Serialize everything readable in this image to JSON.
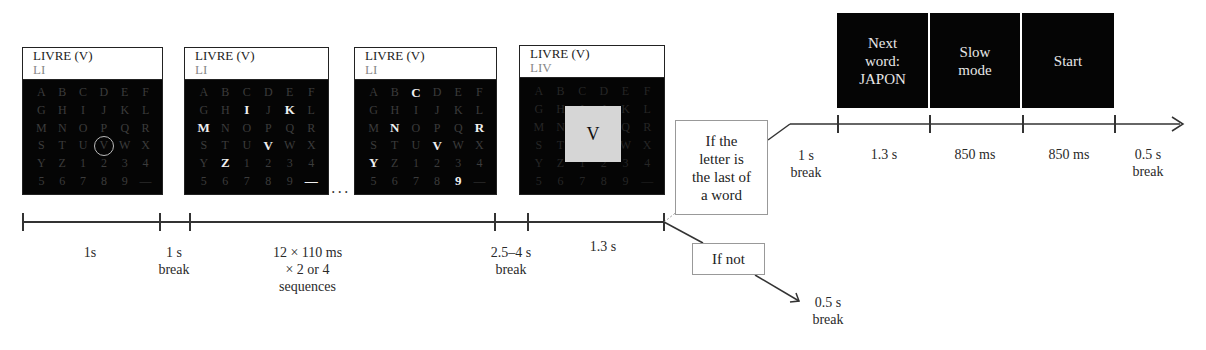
{
  "screens": [
    {
      "target": "LIVRE (V)",
      "typed": "LI",
      "grid": [
        "A",
        "B",
        "C",
        "D",
        "E",
        "F",
        "G",
        "H",
        "I",
        "J",
        "K",
        "L",
        "M",
        "N",
        "O",
        "P",
        "Q",
        "R",
        "S",
        "T",
        "U",
        "V",
        "W",
        "X",
        "Y",
        "Z",
        "1",
        "2",
        "3",
        "4",
        "5",
        "6",
        "7",
        "8",
        "9",
        "—"
      ],
      "highlighted": [],
      "circled": [
        21
      ]
    },
    {
      "target": "LIVRE (V)",
      "typed": "LI",
      "grid": [
        "A",
        "B",
        "C",
        "D",
        "E",
        "F",
        "G",
        "H",
        "I",
        "J",
        "K",
        "L",
        "M",
        "N",
        "O",
        "P",
        "Q",
        "R",
        "S",
        "T",
        "U",
        "V",
        "W",
        "X",
        "Y",
        "Z",
        "1",
        "2",
        "3",
        "4",
        "5",
        "6",
        "7",
        "8",
        "9",
        "—"
      ],
      "highlighted": [
        8,
        10,
        12,
        21,
        25,
        35
      ],
      "circled": []
    },
    {
      "target": "LIVRE (V)",
      "typed": "LI",
      "grid": [
        "A",
        "B",
        "C",
        "D",
        "E",
        "F",
        "G",
        "H",
        "I",
        "J",
        "K",
        "L",
        "M",
        "N",
        "O",
        "P",
        "Q",
        "R",
        "S",
        "T",
        "U",
        "V",
        "W",
        "X",
        "Y",
        "Z",
        "1",
        "2",
        "3",
        "4",
        "5",
        "6",
        "7",
        "8",
        "9",
        "—"
      ],
      "highlighted": [
        2,
        13,
        17,
        21,
        24,
        34
      ],
      "circled": []
    },
    {
      "target": "LIVRE (V)",
      "typed": "LIV",
      "grid": [
        "A",
        "B",
        "C",
        "D",
        "E",
        "F",
        "G",
        "H",
        "I",
        "J",
        "K",
        "L",
        "M",
        "N",
        "O",
        "P",
        "Q",
        "R",
        "S",
        "T",
        "U",
        "V",
        "W",
        "X",
        "Y",
        "Z",
        "1",
        "2",
        "3",
        "4",
        "5",
        "6",
        "7",
        "8",
        "9",
        "—"
      ],
      "highlighted": [],
      "circled": [],
      "feedback_letter": "V"
    }
  ],
  "ellipsis": "...",
  "main_timeline": {
    "labels": [
      {
        "text": "1s"
      },
      {
        "line1": "1 s",
        "line2": "break"
      },
      {
        "line1": "12 × 110 ms",
        "line2": "× 2 or 4",
        "line3": "sequences"
      },
      {
        "line1": "2.5–4 s",
        "line2": "break"
      },
      {
        "text": "1.3 s"
      }
    ]
  },
  "branch_yes": {
    "condition": [
      "If the",
      "letter is",
      "the last of",
      "a word"
    ],
    "break_label": {
      "line1": "1 s",
      "line2": "break"
    },
    "screens": [
      {
        "lines": [
          "Next",
          "word:",
          "JAPON"
        ]
      },
      {
        "lines": [
          "Slow",
          "mode"
        ]
      },
      {
        "lines": [
          "Start"
        ]
      }
    ],
    "durations": [
      "1.3 s",
      "850 ms",
      "850 ms"
    ],
    "end_break": {
      "line1": "0.5 s",
      "line2": "break"
    }
  },
  "branch_no": {
    "condition": "If not",
    "break_label": {
      "line1": "0.5 s",
      "line2": "break"
    }
  },
  "colors": {
    "screen_bg": "#050505",
    "feedback_bg": "#d6d6d6",
    "line": "#333333"
  }
}
